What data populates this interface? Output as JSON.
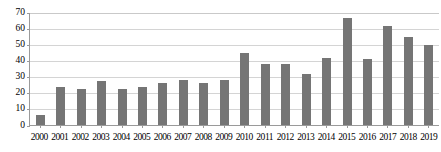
{
  "chart_data": {
    "type": "bar",
    "title": "",
    "subtitle": "",
    "xlabel": "",
    "ylabel": "",
    "ylim": [
      0,
      70
    ],
    "yticks": [
      0,
      10,
      20,
      30,
      40,
      50,
      60,
      70
    ],
    "grid": true,
    "legend": false,
    "legend_position": "none",
    "bar_color": "#757575",
    "axis_color": "#9a9a9a",
    "gridline_color": "#d4d4d4",
    "categories": [
      "2000",
      "2001",
      "2002",
      "2003",
      "2004",
      "2005",
      "2006",
      "2007",
      "2008",
      "2009",
      "2010",
      "2011",
      "2012",
      "2013",
      "2014",
      "2015",
      "2016",
      "2017",
      "2018",
      "2019"
    ],
    "values": [
      6,
      23,
      22,
      27,
      22,
      23,
      25.5,
      27.5,
      26,
      27.5,
      44,
      37.5,
      37.5,
      31,
      41.5,
      66,
      40.5,
      61,
      54,
      49
    ]
  }
}
